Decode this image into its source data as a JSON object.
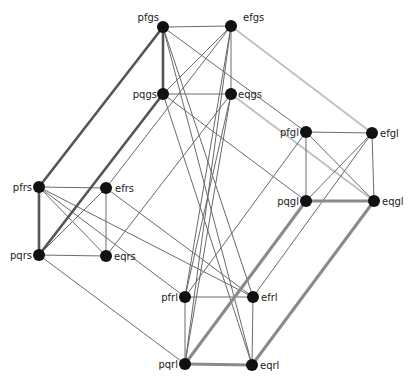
{
  "graph": {
    "colors": {
      "node": "#111111",
      "edge_thin": "#6a6a6a",
      "edge_thick_dark": "#555555",
      "edge_thick_gray": "#8a8a8a",
      "edge_light": "#bdbdbd"
    },
    "nodes": [
      {
        "id": "pfgs",
        "label": "pfgs",
        "x": 163,
        "y": 27,
        "lx": -4,
        "ly": -6,
        "anchor": "end"
      },
      {
        "id": "efgs",
        "label": "efgs",
        "x": 231,
        "y": 26,
        "lx": 12,
        "ly": -5,
        "anchor": "start"
      },
      {
        "id": "pqgs",
        "label": "pqgs",
        "x": 163,
        "y": 94,
        "lx": -6,
        "ly": 4,
        "anchor": "end"
      },
      {
        "id": "eqgs",
        "label": "eqgs",
        "x": 231,
        "y": 94,
        "lx": 7,
        "ly": 4,
        "anchor": "start"
      },
      {
        "id": "pfgl",
        "label": "pfgl",
        "x": 306,
        "y": 132,
        "lx": -7,
        "ly": 4,
        "anchor": "end"
      },
      {
        "id": "efgl",
        "label": "efgl",
        "x": 372,
        "y": 133,
        "lx": 8,
        "ly": 4,
        "anchor": "start"
      },
      {
        "id": "pqgl",
        "label": "pqgl",
        "x": 306,
        "y": 201,
        "lx": -7,
        "ly": 4,
        "anchor": "end"
      },
      {
        "id": "eqgl",
        "label": "eqgl",
        "x": 374,
        "y": 201,
        "lx": 8,
        "ly": 4,
        "anchor": "start"
      },
      {
        "id": "pfrs",
        "label": "pfrs",
        "x": 39,
        "y": 187,
        "lx": -7,
        "ly": 4,
        "anchor": "end"
      },
      {
        "id": "efrs",
        "label": "efrs",
        "x": 106,
        "y": 188,
        "lx": 9,
        "ly": 4,
        "anchor": "start"
      },
      {
        "id": "pqrs",
        "label": "pqrs",
        "x": 39,
        "y": 255,
        "lx": -7,
        "ly": 4,
        "anchor": "end"
      },
      {
        "id": "eqrs",
        "label": "eqrs",
        "x": 106,
        "y": 256,
        "lx": 8,
        "ly": 4,
        "anchor": "start"
      },
      {
        "id": "pfrl",
        "label": "pfrl",
        "x": 185,
        "y": 297,
        "lx": -7,
        "ly": 4,
        "anchor": "end"
      },
      {
        "id": "efrl",
        "label": "efrl",
        "x": 253,
        "y": 297,
        "lx": 8,
        "ly": 4,
        "anchor": "start"
      },
      {
        "id": "pqrl",
        "label": "pqrl",
        "x": 185,
        "y": 364,
        "lx": -7,
        "ly": 4,
        "anchor": "end"
      },
      {
        "id": "eqrl",
        "label": "eqrl",
        "x": 252,
        "y": 365,
        "lx": 8,
        "ly": 4,
        "anchor": "start"
      }
    ],
    "edges": [
      {
        "a": "pfgs",
        "b": "efgs",
        "w": "thin"
      },
      {
        "a": "pfgs",
        "b": "pqgs",
        "w": "thick_dark"
      },
      {
        "a": "efgs",
        "b": "eqgs",
        "w": "thin"
      },
      {
        "a": "pqgs",
        "b": "eqgs",
        "w": "thin"
      },
      {
        "a": "efgs",
        "b": "pqgs",
        "w": "thin"
      },
      {
        "a": "pfgl",
        "b": "efgl",
        "w": "thin"
      },
      {
        "a": "pfgl",
        "b": "pqgl",
        "w": "thin"
      },
      {
        "a": "efgl",
        "b": "eqgl",
        "w": "thin"
      },
      {
        "a": "pqgl",
        "b": "eqgl",
        "w": "thick_gray"
      },
      {
        "a": "pfgl",
        "b": "eqgl",
        "w": "thin"
      },
      {
        "a": "efgl",
        "b": "pqgl",
        "w": "thin"
      },
      {
        "a": "pfrs",
        "b": "efrs",
        "w": "thin"
      },
      {
        "a": "pfrs",
        "b": "pqrs",
        "w": "thick_dark"
      },
      {
        "a": "efrs",
        "b": "eqrs",
        "w": "thin"
      },
      {
        "a": "pqrs",
        "b": "eqrs",
        "w": "thin"
      },
      {
        "a": "pfrs",
        "b": "eqrs",
        "w": "thin"
      },
      {
        "a": "efrs",
        "b": "pqrs",
        "w": "thin"
      },
      {
        "a": "pfrl",
        "b": "efrl",
        "w": "thin"
      },
      {
        "a": "pfrl",
        "b": "pqrl",
        "w": "thin"
      },
      {
        "a": "efrl",
        "b": "eqrl",
        "w": "thin"
      },
      {
        "a": "pqrl",
        "b": "eqrl",
        "w": "thick_gray"
      },
      {
        "a": "pfgs",
        "b": "pfrs",
        "w": "thick_dark"
      },
      {
        "a": "pqgs",
        "b": "pqrs",
        "w": "thick_dark"
      },
      {
        "a": "efgs",
        "b": "efrs",
        "w": "thin"
      },
      {
        "a": "eqgs",
        "b": "eqrs",
        "w": "thin"
      },
      {
        "a": "pfgs",
        "b": "pfgl",
        "w": "thin"
      },
      {
        "a": "efgs",
        "b": "efgl",
        "w": "light"
      },
      {
        "a": "eqgs",
        "b": "eqgl",
        "w": "light"
      },
      {
        "a": "pqgs",
        "b": "pqgl",
        "w": "thin"
      },
      {
        "a": "pfrs",
        "b": "pfrl",
        "w": "thin"
      },
      {
        "a": "pqrs",
        "b": "pqrl",
        "w": "thin"
      },
      {
        "a": "efrs",
        "b": "efrl",
        "w": "thin"
      },
      {
        "a": "pfrs",
        "b": "efrl",
        "w": "thin"
      },
      {
        "a": "pqgl",
        "b": "pqrl",
        "w": "thick_gray"
      },
      {
        "a": "eqgl",
        "b": "eqrl",
        "w": "thick_gray"
      },
      {
        "a": "pfgl",
        "b": "pfrl",
        "w": "thin"
      },
      {
        "a": "efgl",
        "b": "efrl",
        "w": "thin"
      },
      {
        "a": "pfgs",
        "b": "efrl",
        "w": "thin"
      },
      {
        "a": "pfgs",
        "b": "eqrl",
        "w": "thin"
      },
      {
        "a": "pqgs",
        "b": "eqrl",
        "w": "thin"
      },
      {
        "a": "efgs",
        "b": "pfrl",
        "w": "thin"
      },
      {
        "a": "efgs",
        "b": "pqrl",
        "w": "thin"
      },
      {
        "a": "eqgs",
        "b": "pqrl",
        "w": "thin"
      },
      {
        "a": "eqgs",
        "b": "pfrl",
        "w": "thin"
      }
    ]
  }
}
